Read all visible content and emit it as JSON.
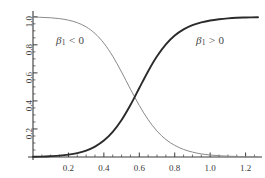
{
  "chart_data": {
    "type": "line",
    "title": "",
    "subtitle": "",
    "xlabel": "",
    "ylabel": "",
    "xlim": [
      0.0,
      1.27
    ],
    "ylim": [
      0.0,
      1.02
    ],
    "grid": false,
    "legend_position": "none",
    "background_color": "#ffffff",
    "axis_color": "#3a3a3a",
    "xticks": [
      0.2,
      0.4,
      0.6,
      0.8,
      1.0,
      1.2
    ],
    "xtick_labels": [
      "0.2",
      "0.4",
      "0.6",
      "0.8",
      "1.0",
      "1.2"
    ],
    "x_minor_tick_step": 0.05,
    "yticks": [
      0.2,
      0.4,
      0.6,
      0.8,
      1.0
    ],
    "ytick_labels": [
      "0.2",
      "0.4",
      "0.6",
      "0.8",
      "1.0"
    ],
    "y_minor_tick_step": 0.05,
    "ytick_label_rotation": -90,
    "crossing_point": {
      "x": 0.62,
      "y": 0.42
    },
    "series": [
      {
        "name": "beta1-negative",
        "label": "β₁ < 0",
        "color": "#8a8a8a",
        "line_width": 1.0,
        "x": [
          0.0,
          0.05,
          0.1,
          0.15,
          0.2,
          0.25,
          0.3,
          0.35,
          0.4,
          0.45,
          0.5,
          0.55,
          0.6,
          0.65,
          0.7,
          0.75,
          0.8,
          0.85,
          0.9,
          0.95,
          1.0,
          1.05,
          1.1,
          1.15,
          1.2,
          1.27
        ],
        "values": [
          0.998,
          0.996,
          0.993,
          0.987,
          0.976,
          0.958,
          0.928,
          0.881,
          0.812,
          0.719,
          0.606,
          0.484,
          0.368,
          0.266,
          0.185,
          0.125,
          0.083,
          0.054,
          0.035,
          0.022,
          0.014,
          0.009,
          0.006,
          0.004,
          0.002,
          0.001
        ]
      },
      {
        "name": "beta1-positive",
        "label": "β₁ > 0",
        "color": "#2b2b2b",
        "line_width": 1.9,
        "x": [
          0.0,
          0.05,
          0.1,
          0.15,
          0.2,
          0.25,
          0.3,
          0.35,
          0.4,
          0.45,
          0.5,
          0.55,
          0.6,
          0.65,
          0.7,
          0.75,
          0.8,
          0.85,
          0.9,
          0.95,
          1.0,
          1.05,
          1.1,
          1.15,
          1.2,
          1.27
        ],
        "values": [
          0.002,
          0.003,
          0.006,
          0.01,
          0.017,
          0.028,
          0.046,
          0.074,
          0.117,
          0.179,
          0.264,
          0.371,
          0.492,
          0.612,
          0.718,
          0.803,
          0.866,
          0.91,
          0.94,
          0.96,
          0.974,
          0.983,
          0.989,
          0.993,
          0.995,
          0.997
        ]
      }
    ],
    "annotations": [
      {
        "name": "annotation-beta-negative",
        "text_html": "β₁ < 0",
        "beta": "β",
        "subscript": "1",
        "relation": "< 0",
        "x": 0.18,
        "y": 0.86
      },
      {
        "name": "annotation-beta-positive",
        "text_html": "β₁ > 0",
        "beta": "β",
        "subscript": "1",
        "relation": "> 0",
        "x": 0.96,
        "y": 0.86
      }
    ]
  }
}
